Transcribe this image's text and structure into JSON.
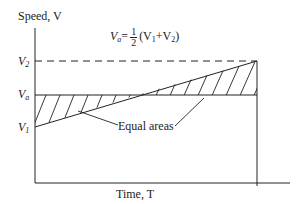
{
  "diagram": {
    "y_axis_label": "Speed, V",
    "x_axis_label": "Time, T",
    "formula": {
      "lhs_var": "V",
      "lhs_sub": "a",
      "equals": "=",
      "frac_num": "1",
      "frac_den": "2",
      "rhs_open": "(V",
      "rhs_sub1": "1",
      "rhs_plus": "+V",
      "rhs_sub2": "2",
      "rhs_close": ")"
    },
    "levels": {
      "v2": {
        "var": "V",
        "sub": "2"
      },
      "va": {
        "var": "V",
        "sub": "a"
      },
      "v1": {
        "var": "V",
        "sub": "1"
      }
    },
    "annotation": "Equal areas",
    "line_color": "#222222"
  }
}
